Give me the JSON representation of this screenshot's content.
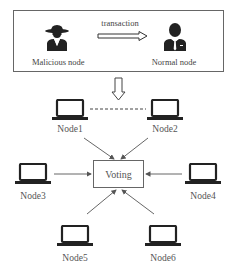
{
  "top_panel": {
    "left_actor": {
      "label": "Malicious node",
      "icon": "spy-person-icon"
    },
    "arrow_label": "transaction",
    "right_actor": {
      "label": "Normal node",
      "icon": "businessman-icon"
    }
  },
  "center": {
    "label": "Voting"
  },
  "nodes": [
    {
      "label": "Node1"
    },
    {
      "label": "Node2"
    },
    {
      "label": "Node3"
    },
    {
      "label": "Node4"
    },
    {
      "label": "Node5"
    },
    {
      "label": "Node6"
    }
  ],
  "colors": {
    "stroke": "#555555",
    "icon": "#222222",
    "text": "#444444"
  }
}
